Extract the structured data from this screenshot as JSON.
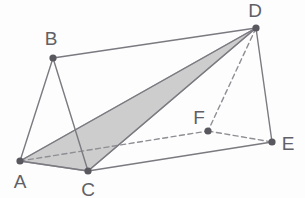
{
  "figure": {
    "name": "triangular-prism-with-shaded-cross-section",
    "canvas": {
      "width": 305,
      "height": 198
    },
    "colors": {
      "background": "#fdfdfd",
      "edge_solid": "#7a7a80",
      "edge_hidden": "#8e8e94",
      "vertex_dot": "#58585e",
      "label_text": "#606066",
      "shaded_face_fill": "#cdcdcd",
      "shaded_face_stroke": "#9a9aa0"
    },
    "vertices": [
      {
        "id": "A",
        "label": "A",
        "x": 20,
        "y": 161,
        "label_x": 20,
        "label_y": 188,
        "hidden": false
      },
      {
        "id": "B",
        "label": "B",
        "x": 53,
        "y": 58,
        "label_x": 51,
        "label_y": 45,
        "hidden": false
      },
      {
        "id": "C",
        "label": "C",
        "x": 88,
        "y": 171,
        "label_x": 88,
        "label_y": 196,
        "hidden": false
      },
      {
        "id": "D",
        "label": "D",
        "x": 256,
        "y": 28,
        "label_x": 255,
        "label_y": 17,
        "hidden": false
      },
      {
        "id": "E",
        "label": "E",
        "x": 272,
        "y": 142,
        "label_x": 288,
        "label_y": 150,
        "hidden": false
      },
      {
        "id": "F",
        "label": "F",
        "x": 208,
        "y": 131,
        "label_x": 199,
        "label_y": 124,
        "hidden": true
      }
    ],
    "edges": [
      {
        "id": "AB",
        "from": "A",
        "to": "B",
        "style": "solid"
      },
      {
        "id": "BC",
        "from": "B",
        "to": "C",
        "style": "solid"
      },
      {
        "id": "AC",
        "from": "A",
        "to": "C",
        "style": "solid"
      },
      {
        "id": "BD",
        "from": "B",
        "to": "D",
        "style": "solid"
      },
      {
        "id": "CE",
        "from": "C",
        "to": "E",
        "style": "solid"
      },
      {
        "id": "DE",
        "from": "D",
        "to": "E",
        "style": "solid"
      },
      {
        "id": "AD",
        "from": "A",
        "to": "D",
        "style": "solid"
      },
      {
        "id": "CD",
        "from": "C",
        "to": "D",
        "style": "solid"
      },
      {
        "id": "AF",
        "from": "A",
        "to": "F",
        "style": "dashed"
      },
      {
        "id": "FE",
        "from": "F",
        "to": "E",
        "style": "dashed"
      },
      {
        "id": "DF",
        "from": "D",
        "to": "F",
        "style": "dashed"
      }
    ],
    "shaded_faces": [
      {
        "id": "ACD",
        "vertices": [
          "A",
          "C",
          "D"
        ],
        "fill": "#cdcdcd"
      }
    ],
    "vertex_dot_radius": 3.6,
    "stroke_width": 1.4,
    "dash_pattern": "5,3.5"
  }
}
